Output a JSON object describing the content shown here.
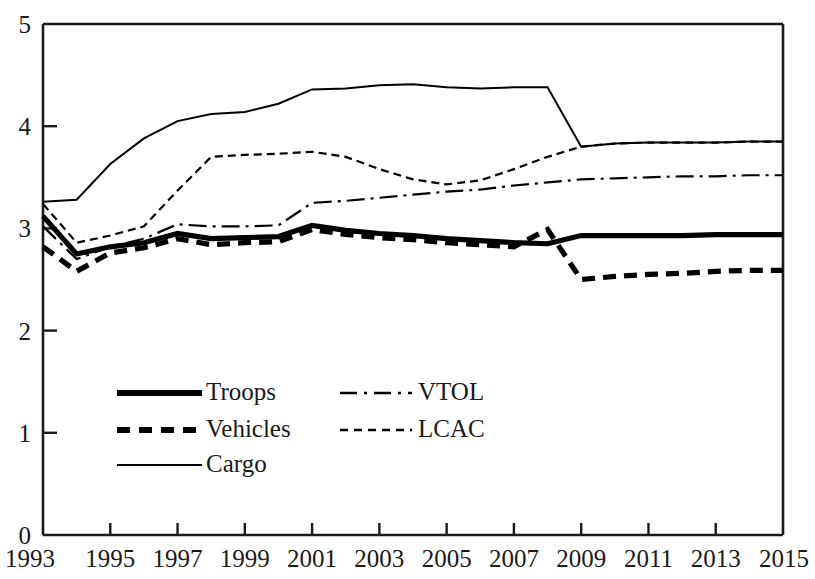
{
  "chart_data": {
    "type": "line",
    "title": "",
    "subtitle": "",
    "xlabel": "",
    "ylabel": "",
    "xlim": [
      1993,
      2015
    ],
    "ylim": [
      0,
      5
    ],
    "grid": false,
    "legend_position": "inside-bottom-left",
    "y_ticks": [
      "0",
      "1",
      "2",
      "3",
      "4",
      "5"
    ],
    "y_tick_values": [
      0,
      1,
      2,
      3,
      4,
      5
    ],
    "x_ticks": [
      "1993",
      "1995",
      "1997",
      "1999",
      "2001",
      "2003",
      "2005",
      "2007",
      "2009",
      "2011",
      "2013",
      "2015"
    ],
    "x_tick_values": [
      1993,
      1995,
      1997,
      1999,
      2001,
      2003,
      2005,
      2007,
      2009,
      2011,
      2013,
      2015
    ],
    "x": [
      1993,
      1994,
      1995,
      1996,
      1997,
      1998,
      1999,
      2000,
      2001,
      2002,
      2003,
      2004,
      2005,
      2006,
      2007,
      2008,
      2009,
      2010,
      2011,
      2012,
      2013,
      2014,
      2015
    ],
    "series": [
      {
        "name": "Troops",
        "style": "solid-thick",
        "values": [
          3.12,
          2.75,
          2.82,
          2.86,
          2.95,
          2.9,
          2.91,
          2.92,
          3.03,
          2.98,
          2.95,
          2.93,
          2.9,
          2.88,
          2.86,
          2.85,
          2.93,
          2.93,
          2.93,
          2.93,
          2.94,
          2.94,
          2.94
        ]
      },
      {
        "name": "Vehicles",
        "style": "dashed-thick",
        "values": [
          2.82,
          2.58,
          2.76,
          2.81,
          2.9,
          2.84,
          2.86,
          2.87,
          2.99,
          2.94,
          2.91,
          2.89,
          2.86,
          2.84,
          2.82,
          2.99,
          2.5,
          2.53,
          2.55,
          2.56,
          2.58,
          2.59,
          2.59
        ]
      },
      {
        "name": "Cargo",
        "style": "solid-thin",
        "values": [
          3.26,
          3.28,
          3.63,
          3.88,
          4.05,
          4.12,
          4.14,
          4.22,
          4.36,
          4.37,
          4.4,
          4.41,
          4.38,
          4.37,
          4.38,
          4.38,
          3.8,
          3.83,
          3.84,
          3.84,
          3.84,
          3.85,
          3.85
        ]
      },
      {
        "name": "VTOL",
        "style": "dash-dot",
        "values": [
          3.02,
          2.7,
          2.82,
          2.9,
          3.04,
          3.02,
          3.02,
          3.03,
          3.25,
          3.27,
          3.3,
          3.33,
          3.36,
          3.38,
          3.42,
          3.45,
          3.48,
          3.49,
          3.5,
          3.51,
          3.51,
          3.52,
          3.52
        ]
      },
      {
        "name": "LCAC",
        "style": "fine-dashed",
        "values": [
          3.24,
          2.86,
          2.93,
          3.02,
          3.37,
          3.7,
          3.72,
          3.73,
          3.75,
          3.7,
          3.58,
          3.48,
          3.43,
          3.47,
          3.58,
          3.7,
          3.8,
          3.83,
          3.84,
          3.84,
          3.84,
          3.85,
          3.85
        ]
      }
    ]
  },
  "legend": {
    "entries": [
      {
        "label": "Troops",
        "key": "troops"
      },
      {
        "label": "Vehicles",
        "key": "vehicles"
      },
      {
        "label": "Cargo",
        "key": "cargo"
      },
      {
        "label": "VTOL",
        "key": "vtol"
      },
      {
        "label": "LCAC",
        "key": "lcac"
      }
    ]
  },
  "colors": {
    "ink": "#1a1a1a",
    "background": "#ffffff",
    "series": "#000000"
  }
}
